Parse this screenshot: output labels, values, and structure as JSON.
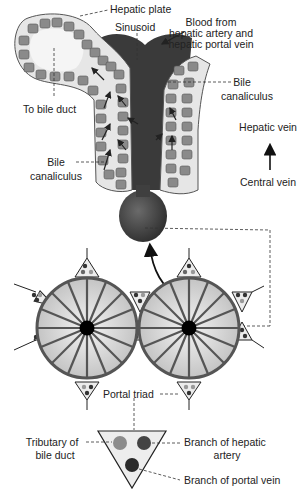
{
  "diagram": {
    "labels": {
      "hepatic_plate": "Hepatic plate",
      "sinusoid": "Sinusoid",
      "blood_from_line1": "Blood from",
      "blood_from_line2": "hepatic artery and",
      "blood_from_line3": "hepatic portal vein",
      "to_bile_duct": "To bile duct",
      "bile_canaliculus_right_line1": "Bile",
      "bile_canaliculus_right_line2": "canaliculus",
      "bile_canaliculus_left_line1": "Bile",
      "bile_canaliculus_left_line2": "canaliculus",
      "hepatic_vein": "Hepatic vein",
      "central_vein": "Central vein",
      "portal_triad": "Portal triad",
      "tributary_line1": "Tributary of",
      "tributary_line2": "bile duct",
      "branch_hepatic_artery_line1": "Branch of hepatic",
      "branch_hepatic_artery_line2": "artery",
      "branch_portal_vein": "Branch of portal vein"
    },
    "lobules": {
      "count": 2,
      "spokes_per_lobule": 16
    },
    "colors": {
      "sinusoid": "#3a3a3a",
      "central_vein": "#444444",
      "hepatocyte": "#8a8a8a",
      "plate_fill": "#e8e8e8",
      "lobule_fill": "#d6d6d6",
      "lobule_rim": "#555555",
      "bile_duct_dot": "#8c8c8c",
      "artery_dot": "#444444",
      "portal_vein_dot": "#2a2a2a",
      "background": "#ffffff"
    }
  }
}
